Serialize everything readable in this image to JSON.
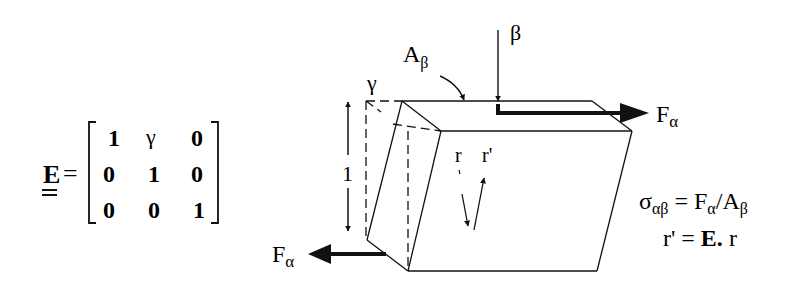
{
  "matrix": {
    "symbol": "E",
    "equals": "=",
    "rows": [
      [
        "1",
        "γ",
        "0"
      ],
      [
        "0",
        "1",
        "0"
      ],
      [
        "0",
        "0",
        "1"
      ]
    ]
  },
  "labels": {
    "gamma": "γ",
    "area": "A",
    "area_sub": "β",
    "beta": "β",
    "height": "1",
    "force_top": "F",
    "force_top_sub": "α",
    "force_bottom": "F",
    "force_bottom_sub": "α",
    "r": "r",
    "r_prime": "r'"
  },
  "equations": {
    "stress_sigma": "σ",
    "stress_sub": "αβ",
    "stress_rhs_F": " = F",
    "stress_rhs_F_sub": "α",
    "stress_rhs_A": "/A",
    "stress_rhs_A_sub": "β",
    "strain_lhs": "r' = ",
    "strain_E": "E.",
    "strain_rhs": " r"
  },
  "colors": {
    "ink": "#111111",
    "background": "#ffffff"
  }
}
